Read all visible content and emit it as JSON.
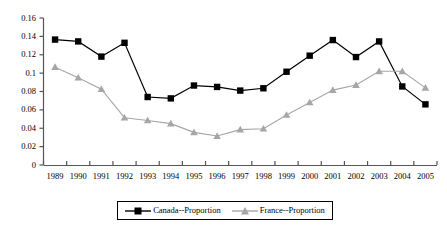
{
  "chart_data": {
    "type": "line",
    "title": "",
    "xlabel": "",
    "ylabel": "",
    "grid": false,
    "legend_position": "bottom",
    "ylim": [
      0,
      0.16
    ],
    "ytick_labels": [
      "0.16",
      "0.14",
      "0.12",
      "0.1",
      "0.08",
      "0.06",
      "0.04",
      "0.02",
      "0"
    ],
    "ytick_values": [
      0.16,
      0.14,
      0.12,
      0.1,
      0.08,
      0.06,
      0.04,
      0.02,
      0
    ],
    "categories": [
      "1989",
      "1990",
      "1991",
      "1992",
      "1993",
      "1994",
      "1995",
      "1996",
      "1997",
      "1998",
      "1999",
      "2000",
      "2001",
      "2002",
      "2003",
      "2004",
      "2005"
    ],
    "series": [
      {
        "name": "Canada--Proportion",
        "color": "#000000",
        "marker": "square",
        "values": [
          0.1365,
          0.1345,
          0.118,
          0.133,
          0.074,
          0.0725,
          0.0865,
          0.085,
          0.081,
          0.0835,
          0.1015,
          0.119,
          0.136,
          0.1175,
          0.1345,
          0.0855,
          0.066
        ]
      },
      {
        "name": "France--Proportion",
        "color": "#a6a6a6",
        "marker": "triangle",
        "values": [
          0.1065,
          0.095,
          0.0825,
          0.0515,
          0.0485,
          0.045,
          0.0355,
          0.0315,
          0.0385,
          0.0395,
          0.0545,
          0.068,
          0.0815,
          0.087,
          0.102,
          0.102,
          0.084
        ]
      }
    ]
  },
  "legend": {
    "entries": [
      {
        "label": "Canada--Proportion"
      },
      {
        "label": "France--Proportion"
      }
    ]
  }
}
